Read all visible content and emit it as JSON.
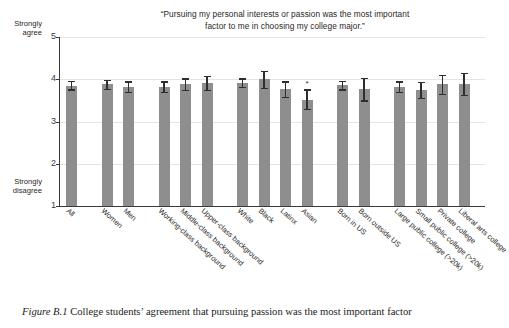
{
  "figure": {
    "caption_label": "Figure B.1",
    "caption_text": "College students’ agreement that pursuing passion was the most important factor"
  },
  "chart": {
    "title_line1": "“Pursuing my personal interests or passion was the most important",
    "title_line2": "factor to me in choosing my college major.”",
    "y_axis": {
      "top_label_line1": "Strongly",
      "top_label_line2": "agree",
      "bottom_label_line1": "Strongly",
      "bottom_label_line2": "disagree",
      "ticks": [
        "5",
        "4",
        "3",
        "2",
        "1"
      ]
    },
    "colors": {
      "bar": "#8e8e8e",
      "error_bar": "#2e2e2e",
      "axis": "#3a3a3a",
      "gridline": "#e6e4e0",
      "text": "#2b2725"
    },
    "significance_marker": "*"
  },
  "chart_data": {
    "type": "bar",
    "title": "“Pursuing my personal interests or passion was the most important factor to me in choosing my college major.”",
    "xlabel": "",
    "ylabel": "",
    "ylim": [
      1,
      5
    ],
    "yticks": [
      1,
      2,
      3,
      4,
      5
    ],
    "y_axis_anchor_high": "Strongly agree",
    "y_axis_anchor_low": "Strongly disagree",
    "grid": true,
    "legend": "none",
    "error_bars": "95% confidence interval",
    "categories": [
      "All",
      "Women",
      "Men",
      "Working-class background",
      "Middle-class background",
      "Upper-class background",
      "White",
      "Black",
      "Latinx",
      "Asian",
      "Born in US",
      "Born outside US",
      "Large public college (>20k)",
      "Small public college (>20k)",
      "Private college",
      "Liberal arts college"
    ],
    "groups": [
      {
        "name": "overall",
        "categories": [
          "All"
        ]
      },
      {
        "name": "gender",
        "categories": [
          "Women",
          "Men"
        ]
      },
      {
        "name": "class background",
        "categories": [
          "Working-class background",
          "Middle-class background",
          "Upper-class background"
        ]
      },
      {
        "name": "race",
        "categories": [
          "White",
          "Black",
          "Latinx",
          "Asian"
        ]
      },
      {
        "name": "nativity",
        "categories": [
          "Born in US",
          "Born outside US"
        ]
      },
      {
        "name": "institution type",
        "categories": [
          "Large public college (>20k)",
          "Small public college (>20k)",
          "Private college",
          "Liberal arts college"
        ]
      }
    ],
    "values": [
      3.85,
      3.88,
      3.82,
      3.82,
      3.88,
      3.9,
      3.92,
      4.0,
      3.76,
      3.52,
      3.86,
      3.76,
      3.82,
      3.74,
      3.88,
      3.88
    ],
    "err_low": [
      3.76,
      3.78,
      3.7,
      3.7,
      3.75,
      3.74,
      3.82,
      3.8,
      3.58,
      3.3,
      3.76,
      3.5,
      3.7,
      3.56,
      3.66,
      3.62
    ],
    "err_high": [
      3.96,
      3.99,
      3.95,
      3.95,
      4.02,
      4.07,
      4.02,
      4.2,
      3.95,
      3.76,
      3.97,
      4.04,
      3.95,
      3.93,
      4.1,
      4.15
    ],
    "significant": [
      false,
      false,
      false,
      false,
      false,
      false,
      false,
      false,
      false,
      true,
      false,
      false,
      false,
      false,
      false,
      false
    ]
  }
}
